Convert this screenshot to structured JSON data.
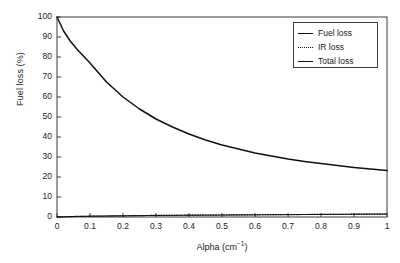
{
  "chart_data": {
    "type": "line",
    "title": "",
    "xlabel": "Alpha (cm⁻¹)",
    "xlabel_base": "Alpha (cm",
    "xlabel_sup": "−1",
    "xlabel_tail": ")",
    "ylabel": "Fuel loss (%)",
    "xlim": [
      0,
      1
    ],
    "ylim": [
      0,
      100
    ],
    "grid": false,
    "legend_position": "upper right",
    "xticks": [
      "0",
      "0.1",
      "0.2",
      "0.3",
      "0.4",
      "0.5",
      "0.6",
      "0.7",
      "0.8",
      "0.9",
      "1"
    ],
    "xtick_values": [
      0,
      0.1,
      0.2,
      0.3,
      0.4,
      0.5,
      0.6,
      0.7,
      0.8,
      0.9,
      1
    ],
    "yticks": [
      "0",
      "10",
      "20",
      "30",
      "40",
      "50",
      "60",
      "70",
      "80",
      "90",
      "100"
    ],
    "ytick_values": [
      0,
      10,
      20,
      30,
      40,
      50,
      60,
      70,
      80,
      90,
      100
    ],
    "x": [
      0,
      0.02,
      0.04,
      0.06,
      0.08,
      0.1,
      0.15,
      0.2,
      0.25,
      0.3,
      0.35,
      0.4,
      0.45,
      0.5,
      0.55,
      0.6,
      0.65,
      0.7,
      0.75,
      0.8,
      0.85,
      0.9,
      0.95,
      1.0
    ],
    "series": [
      {
        "name": "Fuel loss",
        "style": "solid-thick",
        "color": "#101010",
        "values": [
          100,
          93,
          88,
          84,
          80.5,
          77,
          67.5,
          60,
          54,
          49,
          45,
          41.5,
          38.5,
          36,
          34,
          32,
          30.5,
          29,
          27.8,
          26.7,
          25.7,
          24.8,
          24,
          23.2
        ]
      },
      {
        "name": "IR loss",
        "style": "dotted",
        "color": "#101010",
        "values": [
          0,
          0.1,
          0.2,
          0.3,
          0.35,
          0.4,
          0.5,
          0.6,
          0.7,
          0.8,
          0.85,
          0.9,
          0.95,
          1.0,
          1.05,
          1.1,
          1.15,
          1.2,
          1.25,
          1.3,
          1.35,
          1.4,
          1.45,
          1.5
        ]
      },
      {
        "name": "Total loss",
        "style": "solid-thin",
        "color": "#101010",
        "values": [
          0,
          0.1,
          0.2,
          0.3,
          0.35,
          0.4,
          0.5,
          0.6,
          0.7,
          0.8,
          0.85,
          0.9,
          0.95,
          1.0,
          1.05,
          1.1,
          1.15,
          1.2,
          1.25,
          1.3,
          1.35,
          1.4,
          1.45,
          1.5
        ]
      }
    ],
    "legend": [
      {
        "label": "Fuel loss",
        "style": "solid-thick"
      },
      {
        "label": "IR loss",
        "style": "dotted"
      },
      {
        "label": "Total loss",
        "style": "solid-thin"
      }
    ]
  },
  "colors": {
    "axis": "#3c3c3c",
    "curve": "#101010",
    "background": "#ffffff"
  }
}
